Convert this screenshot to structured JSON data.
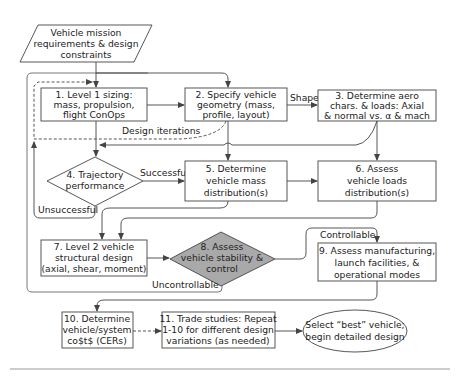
{
  "diagram": {
    "start": {
      "lines": [
        "Vehicle mission",
        "requirements & design",
        "constraints"
      ]
    },
    "nodes": {
      "n1": {
        "lines": [
          "1. Level 1 sizing:",
          "mass, propulsion,",
          "flight ConOps"
        ]
      },
      "n2": {
        "lines": [
          "2. Specify vehicle",
          "geometry (mass,",
          "profile, layout)"
        ]
      },
      "n3": {
        "lines": [
          "3. Determine aero",
          "chars. & loads: Axial",
          "& normal vs. α & mach"
        ]
      },
      "n4": {
        "lines": [
          "4. Trajectory",
          "performance"
        ]
      },
      "n5": {
        "lines": [
          "5. Determine",
          "vehicle mass",
          "distribution(s)"
        ]
      },
      "n6": {
        "lines": [
          "6. Assess",
          "vehicle loads",
          "distribution(s)"
        ]
      },
      "n7": {
        "lines": [
          "7. Level 2 vehicle",
          "structural design",
          "(axial, shear, moment)"
        ]
      },
      "n8": {
        "lines": [
          "8. Assess",
          "vehicle stability &",
          "control"
        ]
      },
      "n9": {
        "lines": [
          "9. Assess manufacturing,",
          "launch facilities, &",
          "operational modes"
        ]
      },
      "n10": {
        "lines": [
          "10. Determine",
          "vehicle/system",
          "co$t$ (CERs)"
        ]
      },
      "n11": {
        "lines": [
          "11. Trade studies: Repeat",
          "1-10 for different design",
          "variations (as needed)"
        ]
      },
      "end": {
        "lines": [
          "Select “best” vehicle;",
          "begin detailed design"
        ]
      }
    },
    "edge_labels": {
      "shape": "Shape",
      "design_iterations": "Design iterations",
      "successful": "Successful",
      "unsuccessful": "Unsuccessful",
      "controllable": "Controllable",
      "uncontrollable": "Uncontrollable"
    },
    "colors": {
      "stroke": "#444444",
      "decision_shaded": "#a9a9a9",
      "background": "#ffffff"
    }
  }
}
